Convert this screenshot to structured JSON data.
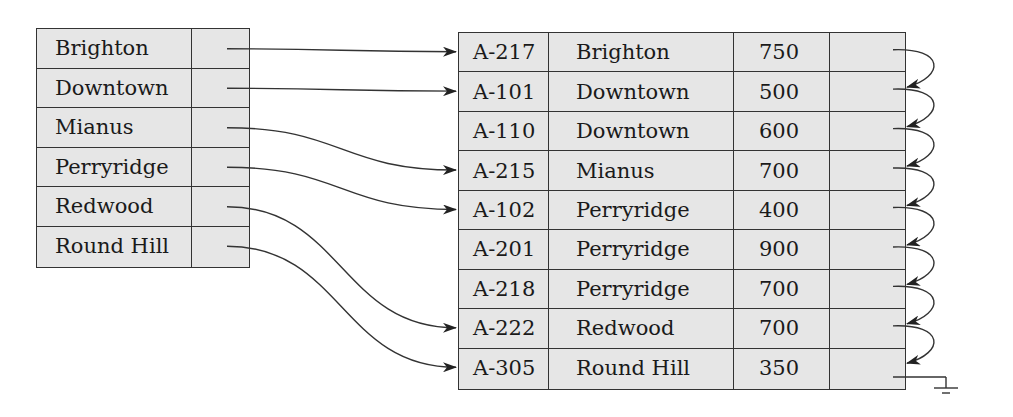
{
  "diagram": {
    "type": "dense-index-with-sorted-file",
    "index": {
      "entries": [
        {
          "key": "Brighton",
          "points_to_row": 0
        },
        {
          "key": "Downtown",
          "points_to_row": 1
        },
        {
          "key": "Mianus",
          "points_to_row": 3
        },
        {
          "key": "Perryridge",
          "points_to_row": 4
        },
        {
          "key": "Redwood",
          "points_to_row": 7
        },
        {
          "key": "Round Hill",
          "points_to_row": 8
        }
      ]
    },
    "file": {
      "records": [
        {
          "account": "A-217",
          "branch": "Brighton",
          "balance": "750"
        },
        {
          "account": "A-101",
          "branch": "Downtown",
          "balance": "500"
        },
        {
          "account": "A-110",
          "branch": "Downtown",
          "balance": "600"
        },
        {
          "account": "A-215",
          "branch": "Mianus",
          "balance": "700"
        },
        {
          "account": "A-102",
          "branch": "Perryridge",
          "balance": "400"
        },
        {
          "account": "A-201",
          "branch": "Perryridge",
          "balance": "900"
        },
        {
          "account": "A-218",
          "branch": "Perryridge",
          "balance": "700"
        },
        {
          "account": "A-222",
          "branch": "Redwood",
          "balance": "700"
        },
        {
          "account": "A-305",
          "branch": "Round Hill",
          "balance": "350"
        }
      ],
      "chain": "each record points to the next; last points to null (ground symbol)"
    },
    "colors": {
      "cell_fill": "#e6e6e6",
      "line": "#333333",
      "background": "#ffffff"
    }
  }
}
